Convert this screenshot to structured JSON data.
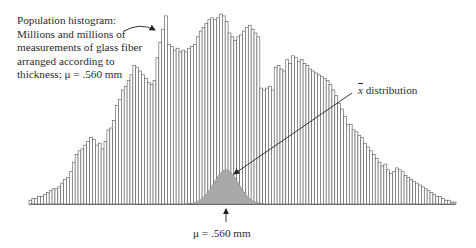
{
  "annotations": {
    "population_label_lines": [
      "Population histogram:",
      "Millions and millions of",
      "measurements of glass fiber",
      "arranged according to",
      "thickness; μ = .560 mm"
    ],
    "xbar_symbol": "x",
    "xbar_label_text": " distribution",
    "mu_label": "μ = .560 mm"
  },
  "colors": {
    "bar_stroke": "#555555",
    "bar_fill": "#ffffff",
    "sampling_fill": "#a9a9a9",
    "arrow": "#222222"
  },
  "chart_data": {
    "type": "bar",
    "title": "",
    "xlabel": "",
    "ylabel": "",
    "grid": false,
    "legend": "none",
    "ylim": [
      0,
      100
    ],
    "series": [
      {
        "name": "Population histogram (glass fiber thickness)",
        "values": [
          2,
          3,
          3,
          4,
          4,
          5,
          6,
          7,
          8,
          8,
          9,
          11,
          13,
          14,
          17,
          22,
          26,
          28,
          29,
          31,
          33,
          35,
          34,
          31,
          32,
          29,
          33,
          39,
          40,
          44,
          52,
          55,
          60,
          62,
          65,
          68,
          73,
          72,
          70,
          68,
          66,
          64,
          63,
          65,
          77,
          85,
          92,
          99,
          84,
          83,
          81,
          82,
          80,
          81,
          80,
          82,
          83,
          84,
          88,
          91,
          93,
          95,
          97,
          98,
          97,
          98,
          100,
          99,
          96,
          90,
          88,
          86,
          88,
          89,
          91,
          93,
          94,
          92,
          90,
          88,
          61,
          60,
          61,
          62,
          60,
          72,
          73,
          71,
          70,
          76,
          74,
          78,
          77,
          75,
          76,
          74,
          73,
          71,
          70,
          69,
          68,
          67,
          66,
          65,
          63,
          60,
          57,
          53,
          50,
          46,
          42,
          42,
          39,
          38,
          36,
          35,
          32,
          30,
          28,
          26,
          24,
          22,
          20,
          21,
          18,
          16,
          17,
          19,
          18,
          17,
          15,
          14,
          13,
          12,
          11,
          10,
          9,
          8,
          7,
          6,
          5,
          4,
          4,
          3,
          2,
          2,
          1,
          1
        ]
      },
      {
        "name": "x̄ distribution",
        "mean_label": "μ = .560 mm",
        "peak": 18,
        "spread_bins": 13
      }
    ],
    "mean": 0.56,
    "mean_units": "mm"
  }
}
